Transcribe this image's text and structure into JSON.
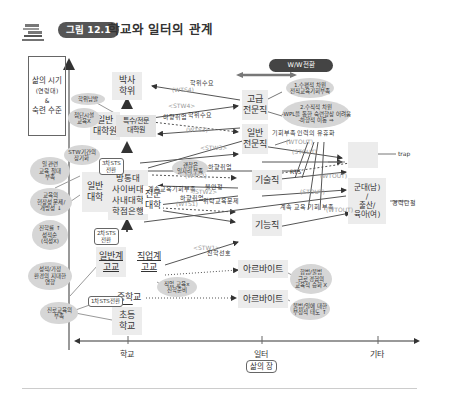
{
  "header": {
    "figure_badge": "그림 12.1",
    "title": "학교와 일터의 관계",
    "icon": "book-stack-icon"
  },
  "legend": {
    "line1": "삶의 시기",
    "line2": "(연령대)",
    "line3": "&",
    "line4": "숙련 수준"
  },
  "wiw_badge": "W/W전환",
  "axis": {
    "x_ticks": [
      "학교",
      "일터",
      "기타"
    ],
    "x_label": "삶의 장"
  },
  "nodes": {
    "phd": "박사\n학위",
    "general_grad": "일반\n대학원",
    "special_grad": "특수/전문\n대학원",
    "general_univ": "일반\n대학",
    "alt_univ": "방통대\n사이버대\n사내대학\n학점은행",
    "college": "전문\n대학",
    "general_hs": "일반계\n고교",
    "voc_hs": "직업계\n고교",
    "middle": "중학교",
    "elementary": "초등\n학교",
    "senior_pro": "고급\n전문직",
    "general_pro": "일반\n전문직",
    "technician": "기술직",
    "skilled": "기능직",
    "parttime1": "아르바이트",
    "parttime2": "아르바이트",
    "unemployed": "실업",
    "military": "군대(남)\n/\n출산/\n육아(여)"
  },
  "transitions": {
    "sts3": "3차STS\n전환",
    "sts2": "2차STS\n전환",
    "sts1": "1차STS전환"
  },
  "bubbles": {
    "degree_abuse": "학위남발",
    "cutting_edge": "첨단시설\n교육X",
    "stw_long": "STW기간의\n장기화",
    "job_edu": "일 관련\n교육 절대\n부족",
    "field_issue": "교육의\n현장성 문제/\n개방성 ↓",
    "advance_grade": "진학률 ↑\n성적순\n(적성X)",
    "family_influence": "성적/가정\n환경의 지대한\n영향",
    "career_edu": "진로교육의\n부족",
    "decent_jobs": "괜찮은\n일자리 부족",
    "voc_edu": "직업 교육x\n진학준비",
    "wiw1": "1.수평적 차원\n전직교육기회부족",
    "wiw2": "2.수직적 차원\n-WPL을 통한 숙련향상 어려움\n-하향적 이동 ⇒",
    "parttime_edu": "합법/불법\n근로 경험의\n교육적 승화 X",
    "parttime_attitude": "불법/일에 대한\n부정적 태도 ↑"
  },
  "labels": {
    "degree_demand1": "학위수요",
    "degree_demand2": "학위수요",
    "underemploy1": "하향취업",
    "underemploy2": "하향취업",
    "underemploy3": "하향취업",
    "lack_opportunity": "기회부족",
    "labor_flex": "인력의 유휴화",
    "instability": "불안정",
    "cont_edu_lack": "계속교육기회부족",
    "retrain_issue": "위탁교육문제",
    "cont_edu_lack2": "계속 교육 기회 부족",
    "advance_pref": "진학선호",
    "rts": "RTS",
    "career_break": "경력단절",
    "trap": "trap"
  },
  "flows": {
    "wts4": "(WTS4)",
    "stw4": "<STW4>",
    "wts3": "(WTS3)",
    "stw3": "<STW3>",
    "wts2": "(WTS2)",
    "stw2": "<STW2>",
    "wts1": "(WTS1)",
    "stw1": "<STW1>",
    "wtout1": "(WTOUT)",
    "stout1": "(STOUT)",
    "wtout2": "(WTOUT)",
    "stout2": "(STOUT)",
    "wtout3": "(WTOUT)"
  }
}
